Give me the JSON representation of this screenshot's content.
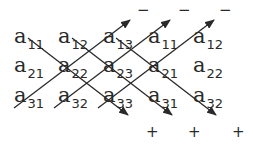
{
  "matrix": {
    "rows": [
      [
        {
          "letter": "a",
          "sub": "11"
        },
        {
          "letter": "a",
          "sub": "12"
        },
        {
          "letter": "a",
          "sub": "13"
        },
        {
          "letter": "a",
          "sub": "11"
        },
        {
          "letter": "a",
          "sub": "12"
        }
      ],
      [
        {
          "letter": "a",
          "sub": "21"
        },
        {
          "letter": "a",
          "sub": "22"
        },
        {
          "letter": "a",
          "sub": "23"
        },
        {
          "letter": "a",
          "sub": "21"
        },
        {
          "letter": "a",
          "sub": "22"
        }
      ],
      [
        {
          "letter": "a",
          "sub": "31"
        },
        {
          "letter": "a",
          "sub": "32"
        },
        {
          "letter": "a",
          "sub": "33"
        },
        {
          "letter": "a",
          "sub": "31"
        },
        {
          "letter": "a",
          "sub": "32"
        }
      ]
    ]
  },
  "signs": {
    "minus": [
      "−",
      "−",
      "−"
    ],
    "plus": [
      "+",
      "+",
      "+"
    ]
  },
  "colors": {
    "ink": "#2a2a2a",
    "background": "#ffffff"
  }
}
